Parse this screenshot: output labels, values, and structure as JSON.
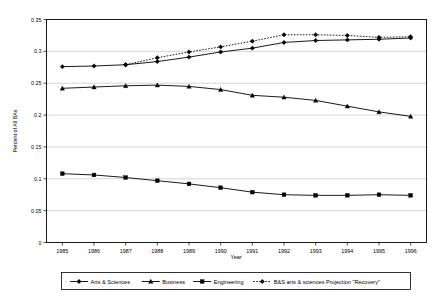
{
  "chart_data": {
    "type": "line",
    "title": "",
    "xlabel": "Year",
    "ylabel": "Percent of All BAs",
    "categories": [
      "1985",
      "1986",
      "1987",
      "1988",
      "1989",
      "1990",
      "1991",
      "1992",
      "1993",
      "1994",
      "1995",
      "1996"
    ],
    "x": [
      1985,
      1986,
      1987,
      1988,
      1989,
      1990,
      1991,
      1992,
      1993,
      1994,
      1995,
      1996
    ],
    "ylim": [
      0,
      0.35
    ],
    "xlim": [
      1985,
      1996
    ],
    "grid": true,
    "legend_position": "bottom",
    "y_ticks": [
      "0",
      "0.05",
      "0.1",
      "0.15",
      "0.2",
      "0.25",
      "0.3",
      "0.35"
    ],
    "y_tick_values": [
      0,
      0.05,
      0.1,
      0.15,
      0.2,
      0.25,
      0.3,
      0.35
    ],
    "series": [
      {
        "name": "Arts & Sciences",
        "marker": "diamond",
        "linestyle": "solid",
        "color": "#000000",
        "values": [
          0.276,
          0.277,
          0.279,
          0.284,
          0.291,
          0.299,
          0.305,
          0.314,
          0.317,
          0.318,
          0.319,
          0.321
        ]
      },
      {
        "name": "Business",
        "marker": "triangle",
        "linestyle": "solid",
        "color": "#000000",
        "values": [
          0.242,
          0.244,
          0.246,
          0.247,
          0.245,
          0.24,
          0.231,
          0.228,
          0.223,
          0.214,
          0.205,
          0.198
        ]
      },
      {
        "name": "Engineering",
        "marker": "square",
        "linestyle": "solid",
        "color": "#000000",
        "values": [
          0.108,
          0.106,
          0.102,
          0.097,
          0.092,
          0.086,
          0.079,
          0.075,
          0.074,
          0.074,
          0.075,
          0.074
        ]
      },
      {
        "name": "B&S arts & sciences Projection \"Recovery\"",
        "marker": "diamond",
        "linestyle": "dotted",
        "color": "#000000",
        "values": [
          null,
          null,
          0.279,
          0.29,
          0.299,
          0.307,
          0.316,
          0.326,
          0.326,
          0.325,
          0.322,
          0.323
        ]
      }
    ]
  },
  "legend": {
    "items": [
      {
        "label": "Arts & Sciences",
        "marker": "diamond",
        "linestyle": "solid"
      },
      {
        "label": "Business",
        "marker": "triangle",
        "linestyle": "solid"
      },
      {
        "label": "Engineering",
        "marker": "square",
        "linestyle": "solid"
      },
      {
        "label": "B&S arts & sciences Projection \"Recovery\"",
        "marker": "diamond",
        "linestyle": "dotted"
      }
    ]
  },
  "colors": {
    "foreground": "#000000",
    "gridline": "#b8b8b8",
    "background": "#ffffff"
  }
}
